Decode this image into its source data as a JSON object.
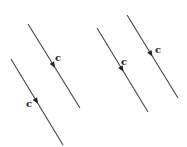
{
  "diagram": {
    "width": 187,
    "height": 147,
    "stroke_color": "#444444",
    "arrow_color": "#222222",
    "groups": [
      {
        "name": "left-pair",
        "lines": [
          {
            "id": "line-a",
            "x1": 28,
            "y1": 24,
            "x2": 80,
            "y2": 108,
            "arrow_t": 0.52,
            "label": "c",
            "label_x": 55,
            "label_y": 61
          },
          {
            "id": "line-b",
            "x1": 11,
            "y1": 59,
            "x2": 63,
            "y2": 145,
            "arrow_t": 0.52,
            "label": "c",
            "label_x": 26,
            "label_y": 107
          }
        ]
      },
      {
        "name": "right-pair",
        "lines": [
          {
            "id": "line-c",
            "x1": 97,
            "y1": 28,
            "x2": 148,
            "y2": 112,
            "arrow_t": 0.52,
            "label": "c",
            "label_x": 121,
            "label_y": 65
          },
          {
            "id": "line-d",
            "x1": 127,
            "y1": 15,
            "x2": 178,
            "y2": 98,
            "arrow_t": 0.5,
            "label": "c",
            "label_x": 155,
            "label_y": 53
          }
        ]
      }
    ]
  }
}
